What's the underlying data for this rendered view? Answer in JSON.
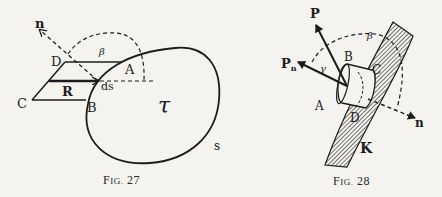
{
  "figures": [
    {
      "caption": "FIG. 27",
      "caption_prefix": "F",
      "caption_small": "IG.",
      "caption_num": "27",
      "labels": {
        "n": "n",
        "beta": "β",
        "D": "D",
        "A": "A",
        "C": "C",
        "R": "R",
        "B": "B",
        "ds": "ds",
        "tau": "τ",
        "s": "s"
      }
    },
    {
      "caption": "FIG. 28",
      "caption_prefix": "F",
      "caption_small": "IG.",
      "caption_num": "28",
      "labels": {
        "P": "P",
        "Pn": "P",
        "Pn_sub": "n",
        "gamma": "γ",
        "beta": "β",
        "B": "B",
        "C": "C",
        "A": "A",
        "D": "D",
        "n": "n",
        "K": "K"
      }
    }
  ],
  "colors": {
    "ink": "#1c1c1c",
    "paper": "#f4f3ef"
  }
}
